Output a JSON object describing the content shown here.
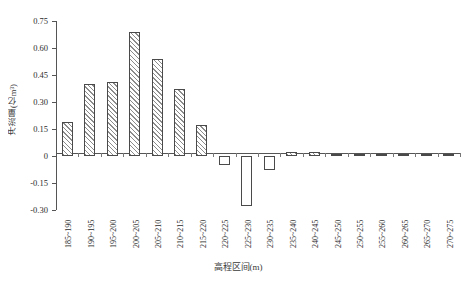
{
  "chart_data": {
    "type": "bar",
    "title": "",
    "xlabel": "高程区间(m)",
    "ylabel": "冲淤量(亿m³)",
    "ylim": [
      -0.3,
      0.75
    ],
    "grid": false,
    "legend": null,
    "ytick_labels": [
      "0.75",
      "0.60",
      "0.45",
      "0.30",
      "0.15",
      "0",
      "-0.15",
      "-0.30"
    ],
    "ytick_values": [
      0.75,
      0.6,
      0.45,
      0.3,
      0.15,
      0,
      -0.15,
      -0.3
    ],
    "categories": [
      "185~190",
      "190~195",
      "195~200",
      "200~205",
      "205~210",
      "210~215",
      "215~220",
      "220~225",
      "225~230",
      "230~235",
      "235~240",
      "240~245",
      "245~250",
      "250~255",
      "255~260",
      "260~265",
      "265~270",
      "270~275"
    ],
    "values": [
      0.19,
      0.4,
      0.41,
      0.69,
      0.54,
      0.37,
      0.17,
      -0.05,
      -0.28,
      -0.08,
      0.02,
      0.02,
      0.003,
      0.003,
      0.01,
      0.008,
      0.008,
      0.01
    ]
  }
}
